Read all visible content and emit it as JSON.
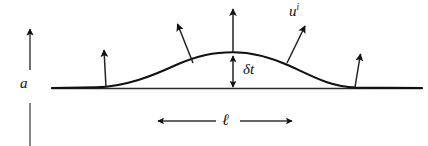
{
  "figure": {
    "type": "physics-schematic-diagram",
    "background_color": "#ffffff",
    "ink_color": "#111111",
    "labels": {
      "amplitude_scale": "a",
      "bump_height": "δt",
      "velocity_base": "u",
      "velocity_superscript": "i",
      "length_scale": "ℓ"
    }
  },
  "geometry": {
    "baseline": {
      "x1": 52,
      "y": 88,
      "x2": 422
    },
    "bump": {
      "left_foot_x": 96,
      "right_foot_x": 356,
      "peak_x": 233,
      "peak_y": 52
    },
    "vertical_scale_bar": {
      "x": 30,
      "arrow_tip_y": 28,
      "arrow_tail_y": 70,
      "lower_segment_y1": 103,
      "lower_segment_y2": 146
    },
    "height_arrow": {
      "x": 233,
      "top_y": 8,
      "bottom_y": 88,
      "double_head_top_y": 55
    },
    "length_arrow": {
      "x1": 158,
      "x2": 292,
      "y": 121
    },
    "normal_arrows": [
      {
        "x1": 106,
        "y1": 87,
        "x2": 104,
        "y2": 49
      },
      {
        "x1": 193,
        "y1": 63,
        "x2": 177,
        "y2": 23
      },
      {
        "x1": 287,
        "y1": 63,
        "x2": 306,
        "y2": 25
      },
      {
        "x1": 355,
        "y1": 87,
        "x2": 361,
        "y2": 53
      }
    ]
  }
}
